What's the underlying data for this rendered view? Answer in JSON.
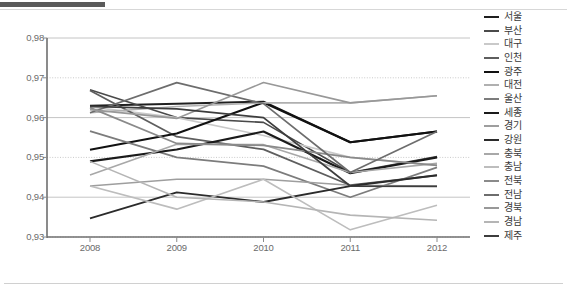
{
  "chart_data": {
    "type": "line",
    "title": "",
    "xlabel": "",
    "ylabel": "",
    "x": [
      "2008",
      "2009",
      "2010",
      "2011",
      "2012"
    ],
    "categories": [
      "2008",
      "2009",
      "2010",
      "2011",
      "2012"
    ],
    "ylim": [
      0.93,
      0.98
    ],
    "yticks": [
      "0,98",
      "0,97",
      "0,96",
      "0,95",
      "0,94",
      "0,93"
    ],
    "ytick_values": [
      0.98,
      0.97,
      0.96,
      0.95,
      0.94,
      0.93
    ],
    "grid": true,
    "legend_position": "right",
    "series": [
      {
        "name": "서울",
        "color": "#1f1f1f",
        "width": 2.0,
        "values": [
          0.963,
          0.9635,
          0.964,
          0.9538,
          0.9565
        ]
      },
      {
        "name": "부산",
        "color": "#4a4a4a",
        "width": 1.6,
        "values": [
          0.967,
          0.96,
          0.9588,
          0.9462,
          0.9502
        ]
      },
      {
        "name": "대구",
        "color": "#c9c9c9",
        "width": 1.6,
        "values": [
          0.9627,
          0.96,
          0.9555,
          0.95,
          0.948
        ]
      },
      {
        "name": "인천",
        "color": "#5e5e5e",
        "width": 1.8,
        "values": [
          0.9668,
          0.9552,
          0.952,
          0.943,
          0.9455
        ]
      },
      {
        "name": "광주",
        "color": "#111111",
        "width": 2.0,
        "values": [
          0.9519,
          0.956,
          0.9638,
          0.9538,
          0.9565
        ]
      },
      {
        "name": "대전",
        "color": "#b0b0b0",
        "width": 1.6,
        "values": [
          0.9612,
          0.9628,
          0.9637,
          0.9637,
          0.9655
        ]
      },
      {
        "name": "울산",
        "color": "#7c7c7c",
        "width": 1.7,
        "values": [
          0.9566,
          0.95,
          0.9478,
          0.94,
          0.9475
        ]
      },
      {
        "name": "세종",
        "color": "#1a1a1a",
        "width": 2.1,
        "values": [
          0.949,
          0.952,
          0.9565,
          0.946,
          0.95
        ]
      },
      {
        "name": "경기",
        "color": "#9e9e9e",
        "width": 1.6,
        "values": [
          0.9428,
          0.9445,
          0.9445,
          0.943,
          0.9428
        ]
      },
      {
        "name": "강원",
        "color": "#2b2b2b",
        "width": 1.9,
        "values": [
          0.9347,
          0.9412,
          0.9388,
          0.9428,
          0.9455
        ]
      },
      {
        "name": "충북",
        "color": "#a8a8a8",
        "width": 1.6,
        "values": [
          0.9456,
          0.9533,
          0.9532,
          0.9462,
          0.9485
        ]
      },
      {
        "name": "충남",
        "color": "#bdbdbd",
        "width": 1.6,
        "values": [
          0.9428,
          0.937,
          0.9445,
          0.9318,
          0.938
        ]
      },
      {
        "name": "전북",
        "color": "#8a8a8a",
        "width": 1.7,
        "values": [
          0.9625,
          0.9535,
          0.953,
          0.95,
          0.948
        ]
      },
      {
        "name": "전남",
        "color": "#6d6d6d",
        "width": 1.7,
        "values": [
          0.9612,
          0.9688,
          0.9635,
          0.9462,
          0.9565
        ]
      },
      {
        "name": "경북",
        "color": "#989898",
        "width": 1.6,
        "values": [
          0.962,
          0.9598,
          0.9688,
          0.9637,
          0.9655
        ]
      },
      {
        "name": "경남",
        "color": "#b5b5b5",
        "width": 1.6,
        "values": [
          0.949,
          0.94,
          0.9388,
          0.9355,
          0.9342
        ]
      },
      {
        "name": "제주",
        "color": "#3d3d3d",
        "width": 1.8,
        "values": [
          0.9628,
          0.9622,
          0.96,
          0.9428,
          0.9427
        ]
      }
    ]
  }
}
